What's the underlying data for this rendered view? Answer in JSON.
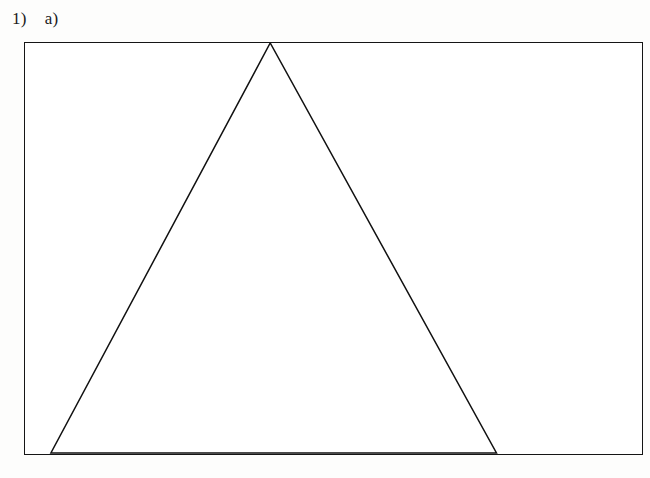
{
  "header": {
    "item_number": "1)",
    "part_label": "a)"
  },
  "figure": {
    "highlight_color": "#b2b2b2",
    "border_color": "#151515",
    "rule_color": "#8d8d8d",
    "triangle_color": "#111111"
  },
  "chart_data": {
    "type": "table",
    "xlabel": "",
    "ylabel": "",
    "row_label_prefix": "n =",
    "highlighted_row_index": 3,
    "rows": [
      {
        "label": "n = 0",
        "n": 0,
        "values": [
          1
        ],
        "highlighted": false
      },
      {
        "label": "n = 1",
        "n": 1,
        "values": [
          1,
          1
        ],
        "highlighted": false
      },
      {
        "label": "n = 2",
        "n": 2,
        "values": [
          1,
          2,
          1
        ],
        "highlighted": false
      },
      {
        "label": "n = 3",
        "n": 3,
        "values": [
          1,
          3,
          3,
          1
        ],
        "highlighted": true
      },
      {
        "label": "n = 4",
        "n": 4,
        "values": [
          1,
          4,
          6,
          4,
          1
        ],
        "highlighted": false
      },
      {
        "label": "n = 5",
        "n": 5,
        "values": [
          1,
          5,
          10,
          10,
          5,
          1
        ],
        "highlighted": false
      },
      {
        "label": "n = 6",
        "n": 6,
        "values": [
          1,
          6,
          15,
          20,
          15,
          6,
          1
        ],
        "highlighted": false
      },
      {
        "label": "n = 7",
        "n": 7,
        "values": [
          1,
          7,
          21,
          35,
          35,
          21,
          7,
          1
        ],
        "highlighted": false
      }
    ]
  }
}
